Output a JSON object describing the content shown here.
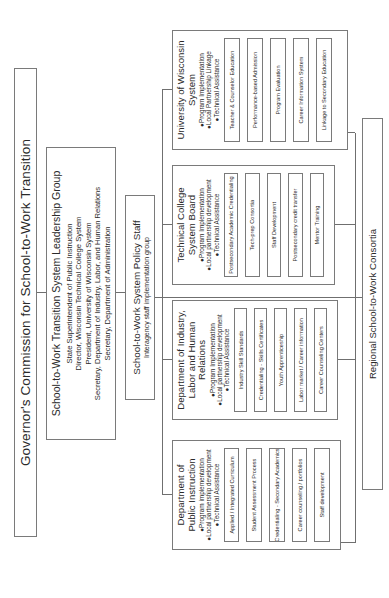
{
  "governor": {
    "title": "Governor's Commission for School-to-Work Transition"
  },
  "leadership": {
    "title": "School-to-Work Transition System Leadership Group",
    "members": [
      "State Superintendent of Public Instruction",
      "Director, Wisconsin Technical College System",
      "President, University of Wisconsin System",
      "Secretary, Department of Industry, Labor, and Human Relations",
      "Secretary, Department of Administration"
    ]
  },
  "policy_staff": {
    "title": "School-to-Work System Policy Staff",
    "subtitle": "Interagency staff implementation group"
  },
  "departments": [
    {
      "name_line1": "Department of",
      "name_line2": "Public Instruction",
      "name_line3": "",
      "bullets": [
        "●Program implementation",
        "●Local partnership development",
        "●Technical Assistance"
      ],
      "items": [
        "Applied / Integrated Curriculum",
        "Student Assessment Process",
        "Credentialing - Secondary Academics",
        "Career counseling / portfolios",
        "Staff development"
      ]
    },
    {
      "name_line1": "Department of Industry,",
      "name_line2": "Labor and Human Relations",
      "name_line3": "",
      "bullets": [
        "●Program Implementation",
        "●Local partnership development",
        "●Technical Assistance"
      ],
      "items": [
        "Industry Skill Standards",
        "Credentialing - Skills Certificates",
        "Youth Apprenticeship",
        "Labor market / Career information",
        "Career Counseling Centers"
      ]
    },
    {
      "name_line1": "Technical College",
      "name_line2": "System Board",
      "name_line3": "",
      "bullets": [
        "●Program Implementation",
        "●Local partnership development",
        "●Technical Assistance"
      ],
      "items": [
        "Postsecondary Academic Credentialing",
        "Tech-prep Consortia",
        "Staff Development",
        "Postsecondary credit transfer",
        "Mentor Training"
      ]
    },
    {
      "name_line1": "University of Wisconsin",
      "name_line2": "System",
      "name_line3": "",
      "bullets": [
        "●Program Implementation",
        "●Local Partnership Linkage",
        "●Technical Assistance"
      ],
      "items": [
        "Teacher & Counselor Education",
        "Performance-based Admission",
        "Program Evaluation",
        "Career Information System",
        "Linkage to Secondary Education"
      ]
    }
  ],
  "regional": {
    "title": "Regional School-to-Work Consortia"
  }
}
